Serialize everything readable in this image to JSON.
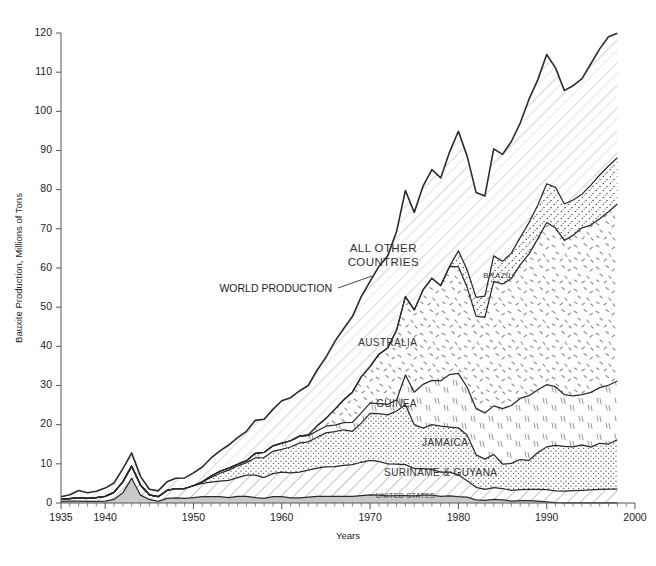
{
  "chart_data": {
    "type": "area",
    "title": "",
    "xlabel": "Years",
    "ylabel": "Bauxite Production, Millions of Tons",
    "xlim": [
      1935,
      2000
    ],
    "ylim": [
      0,
      120
    ],
    "xticks": [
      1935,
      1940,
      1950,
      1960,
      1970,
      1980,
      1990,
      2000
    ],
    "xtick_labels": [
      "1935",
      "1940",
      "1950",
      "1960",
      "1970",
      "1980",
      "1990",
      "2000"
    ],
    "yticks": [
      0,
      10,
      20,
      30,
      40,
      50,
      60,
      70,
      80,
      90,
      100,
      110,
      120
    ],
    "ytick_labels": [
      "0",
      "10",
      "20",
      "30",
      "40",
      "50",
      "60",
      "70",
      "80",
      "90",
      "100",
      "110",
      "120"
    ],
    "grid": false,
    "legend_position": "inline-labels",
    "stacking": "cumulative-from-bottom",
    "annotations": [
      {
        "text": "WORLD PRODUCTION",
        "kind": "callout-with-leader",
        "x": 1962.0,
        "y": 49.0
      },
      {
        "text": "ALL OTHER COUNTRIES",
        "kind": "band-label",
        "x": 1971.5,
        "y": 64.0
      },
      {
        "text": "BRAZIL",
        "kind": "band-label",
        "x": 1984.5,
        "y": 57.5
      },
      {
        "text": "AUSTRALIA",
        "kind": "band-label",
        "x": 1972.0,
        "y": 40.0
      },
      {
        "text": "GUINEA",
        "kind": "band-label",
        "x": 1973.0,
        "y": 24.5
      },
      {
        "text": "JAMAICA",
        "kind": "band-label",
        "x": 1978.5,
        "y": 14.5
      },
      {
        "text": "SURINAME & GUYANA",
        "kind": "band-label",
        "x": 1978.0,
        "y": 7.0
      },
      {
        "text": "UNITED STATES",
        "kind": "band-label",
        "x": 1974.0,
        "y": 1.4
      }
    ],
    "x": [
      1935,
      1936,
      1937,
      1938,
      1939,
      1940,
      1941,
      1942,
      1943,
      1944,
      1945,
      1946,
      1947,
      1948,
      1949,
      1950,
      1951,
      1952,
      1953,
      1954,
      1955,
      1956,
      1957,
      1958,
      1959,
      1960,
      1961,
      1962,
      1963,
      1964,
      1965,
      1966,
      1967,
      1968,
      1969,
      1970,
      1971,
      1972,
      1973,
      1974,
      1975,
      1976,
      1977,
      1978,
      1979,
      1980,
      1981,
      1982,
      1983,
      1984,
      1985,
      1986,
      1987,
      1988,
      1989,
      1990,
      1991,
      1992,
      1993,
      1994,
      1995,
      1996,
      1997,
      1998
    ],
    "series": [
      {
        "name": "UNITED STATES",
        "fill": "solid-gray",
        "color": "#c9c9c9",
        "values": [
          0.4,
          0.5,
          0.5,
          0.4,
          0.4,
          0.5,
          0.9,
          2.6,
          6.3,
          2.0,
          0.9,
          0.4,
          1.2,
          1.3,
          1.2,
          1.4,
          1.6,
          1.6,
          1.6,
          1.4,
          1.7,
          1.7,
          1.4,
          1.2,
          1.6,
          1.6,
          1.3,
          1.3,
          1.5,
          1.7,
          1.7,
          1.7,
          1.7,
          1.7,
          1.9,
          2.1,
          2.0,
          1.8,
          1.9,
          1.9,
          1.8,
          2.0,
          2.0,
          1.7,
          1.8,
          1.6,
          1.5,
          0.8,
          0.7,
          0.9,
          0.8,
          0.5,
          0.6,
          0.6,
          0.5,
          0.3,
          0.1,
          0.05,
          0.05,
          0.05,
          0.05,
          0.05,
          0.05,
          0.05
        ]
      },
      {
        "name": "SURINAME & GUYANA",
        "fill": "diagonal-hatch",
        "color": "#ffffff",
        "values": [
          0.5,
          0.6,
          0.9,
          0.8,
          1.0,
          1.2,
          1.8,
          2.8,
          3.1,
          2.6,
          1.2,
          1.2,
          2.0,
          2.4,
          2.5,
          3.0,
          3.4,
          3.7,
          4.0,
          4.4,
          4.8,
          5.4,
          5.7,
          5.3,
          5.9,
          6.3,
          6.4,
          6.6,
          6.9,
          7.2,
          7.5,
          7.6,
          7.9,
          8.1,
          8.5,
          8.8,
          8.6,
          8.2,
          8.0,
          7.9,
          7.0,
          6.8,
          6.6,
          6.2,
          6.1,
          5.6,
          4.2,
          3.2,
          2.8,
          3.0,
          2.9,
          2.7,
          2.8,
          2.9,
          3.0,
          3.1,
          3.0,
          3.0,
          3.1,
          3.2,
          3.3,
          3.4,
          3.5,
          3.5
        ]
      },
      {
        "name": "JAMAICA",
        "fill": "stipple-dots",
        "color": "#ffffff",
        "values": [
          0,
          0,
          0,
          0,
          0,
          0,
          0,
          0,
          0,
          0,
          0,
          0,
          0,
          0,
          0,
          0,
          0.4,
          1.2,
          2.0,
          2.6,
          3.0,
          3.2,
          4.4,
          5.1,
          5.7,
          5.8,
          6.6,
          7.4,
          7.2,
          7.9,
          8.7,
          8.9,
          9.1,
          8.5,
          10.0,
          12.0,
          12.2,
          12.5,
          13.6,
          15.3,
          11.2,
          10.3,
          11.4,
          11.7,
          11.5,
          12.0,
          11.6,
          8.3,
          7.7,
          8.5,
          6.2,
          6.9,
          7.7,
          7.4,
          9.4,
          10.9,
          11.6,
          11.4,
          11.2,
          11.6,
          10.9,
          11.8,
          11.5,
          12.6
        ]
      },
      {
        "name": "GUINEA",
        "fill": "vertical-dashes",
        "color": "#ffffff",
        "values": [
          0,
          0,
          0,
          0,
          0,
          0,
          0,
          0,
          0,
          0,
          0,
          0,
          0,
          0,
          0,
          0,
          0,
          0.4,
          0.5,
          0.5,
          0.4,
          0.5,
          1.2,
          1.3,
          1.4,
          1.6,
          1.6,
          1.7,
          1.6,
          1.6,
          1.7,
          1.7,
          1.8,
          2.3,
          2.6,
          2.6,
          2.6,
          2.7,
          2.8,
          7.6,
          8.3,
          11.2,
          11.3,
          11.6,
          13.4,
          13.9,
          12.2,
          11.8,
          11.8,
          12.4,
          14.2,
          14.8,
          15.6,
          16.5,
          16.0,
          15.9,
          15.0,
          13.2,
          13.0,
          12.8,
          14.0,
          14.2,
          15.0,
          15.0
        ]
      },
      {
        "name": "AUSTRALIA",
        "fill": "speckle-dashes",
        "color": "#ffffff",
        "values": [
          0,
          0,
          0,
          0,
          0,
          0,
          0,
          0,
          0,
          0,
          0,
          0,
          0,
          0,
          0,
          0,
          0,
          0,
          0,
          0,
          0,
          0,
          0,
          0,
          0,
          0,
          0,
          0.1,
          0.2,
          1.3,
          2.0,
          4.0,
          5.8,
          7.7,
          9.2,
          9.3,
          12.6,
          14.4,
          17.8,
          20.0,
          21.0,
          24.1,
          26.1,
          24.3,
          27.6,
          27.2,
          25.5,
          23.6,
          24.4,
          31.8,
          31.8,
          32.4,
          34.1,
          36.2,
          38.6,
          41.4,
          40.5,
          39.4,
          41.0,
          42.6,
          42.7,
          43.1,
          44.3,
          45.2
        ]
      },
      {
        "name": "BRAZIL",
        "fill": "stipple-dots-coarse",
        "color": "#ffffff",
        "values": [
          0,
          0,
          0,
          0,
          0,
          0,
          0,
          0,
          0,
          0,
          0,
          0,
          0,
          0,
          0,
          0,
          0,
          0,
          0,
          0,
          0,
          0,
          0,
          0,
          0,
          0,
          0,
          0,
          0,
          0,
          0,
          0,
          0,
          0,
          0,
          0,
          0,
          0,
          0,
          0,
          0,
          0,
          0,
          0,
          0,
          4.1,
          4.5,
          4.8,
          5.4,
          6.5,
          5.8,
          6.5,
          7.0,
          8.0,
          8.6,
          9.9,
          10.4,
          9.3,
          9.0,
          8.6,
          10.2,
          11.2,
          11.7,
          11.8
        ]
      },
      {
        "name": "ALL OTHER COUNTRIES",
        "fill": "light-diagonal-hatch",
        "color": "#ffffff",
        "values": [
          0.7,
          1.0,
          1.8,
          1.4,
          1.6,
          2.1,
          2.4,
          3.3,
          3.4,
          2.2,
          1.4,
          1.5,
          2.2,
          2.6,
          2.7,
          3.3,
          3.8,
          4.6,
          5.2,
          5.9,
          6.8,
          7.5,
          8.4,
          8.5,
          9.3,
          10.8,
          11.0,
          11.5,
          12.6,
          14.2,
          15.6,
          17.3,
          18.2,
          19.3,
          20.5,
          21.8,
          22.4,
          23.5,
          25.2,
          27.1,
          24.9,
          26.5,
          27.7,
          27.5,
          29.2,
          30.5,
          29.0,
          26.8,
          25.6,
          27.3,
          27.3,
          28.5,
          29.2,
          31.5,
          32.0,
          33.0,
          30.5,
          29.0,
          29.2,
          29.5,
          31.0,
          32.2,
          33.0,
          31.8
        ]
      }
    ],
    "total_series": {
      "name": "WORLD PRODUCTION",
      "description": "Top boundary of the stacked area = sum of all country bands"
    }
  }
}
